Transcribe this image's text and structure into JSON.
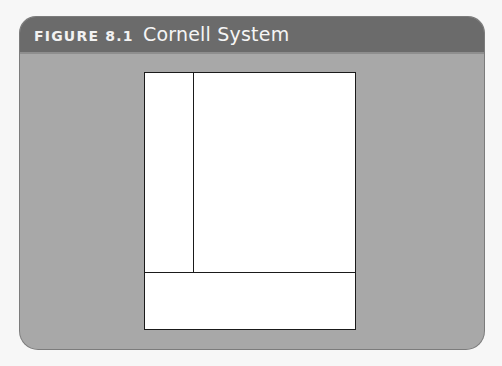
{
  "figure": {
    "label": "FIGURE 8.1",
    "title": "Cornell System"
  },
  "colors": {
    "header_bg": "#6b6b6b",
    "body_bg": "#a8a8a8",
    "page_bg": "#ffffff",
    "rule_color": "#1a1a1a",
    "header_text": "#f2f2f2"
  },
  "diagram": {
    "regions": [
      {
        "name": "cue-column",
        "position": "left"
      },
      {
        "name": "notes-area",
        "position": "right"
      },
      {
        "name": "summary-area",
        "position": "bottom"
      }
    ]
  }
}
